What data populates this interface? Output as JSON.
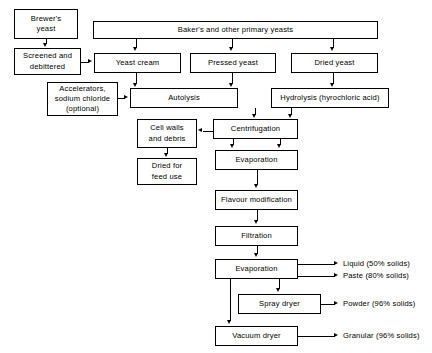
{
  "diagram": {
    "type": "process-flowchart",
    "background_color": "#ffffff",
    "line_color": "#000000",
    "text_color": "#000000",
    "nodes": [
      {
        "id": "brewers_yeast",
        "label": "Brewer's\nyeast",
        "x": 14,
        "y": 9,
        "w": 64,
        "h": 30
      },
      {
        "id": "bakers_yeast",
        "label": "Baker's and other primary yeasts",
        "x": 93,
        "y": 21,
        "w": 285,
        "h": 18
      },
      {
        "id": "screened_debittered",
        "label": "Screened and\ndebittered",
        "x": 14,
        "y": 48,
        "w": 67,
        "h": 27
      },
      {
        "id": "yeast_cream",
        "label": "Yeast cream",
        "x": 94,
        "y": 53,
        "w": 87,
        "h": 20
      },
      {
        "id": "pressed_yeast",
        "label": "Pressed yeast",
        "x": 190,
        "y": 53,
        "w": 86,
        "h": 20
      },
      {
        "id": "dried_yeast",
        "label": "Dried yeast",
        "x": 291,
        "y": 53,
        "w": 87,
        "h": 20
      },
      {
        "id": "accelerators",
        "label": "Accelerators,\nsodium chloride\n(optional)",
        "x": 47,
        "y": 82,
        "w": 71,
        "h": 34
      },
      {
        "id": "autolysis",
        "label": "Autolysis",
        "x": 130,
        "y": 88,
        "w": 108,
        "h": 20
      },
      {
        "id": "hydrolysis",
        "label": "Hydrolysis (hyrochloric acid)",
        "x": 271,
        "y": 88,
        "w": 118,
        "h": 20
      },
      {
        "id": "cell_walls",
        "label": "Cell walls\nand debris",
        "x": 137,
        "y": 119,
        "w": 60,
        "h": 29
      },
      {
        "id": "centrifugation",
        "label": "Centrifugation",
        "x": 213,
        "y": 119,
        "w": 85,
        "h": 20
      },
      {
        "id": "dried_feed_use",
        "label": "Dried for\nfeed use",
        "x": 137,
        "y": 158,
        "w": 60,
        "h": 27
      },
      {
        "id": "evaporation_1",
        "label": "Evaporation",
        "x": 215,
        "y": 150,
        "w": 83,
        "h": 20
      },
      {
        "id": "flavour_modification",
        "label": "Flavour modification",
        "x": 215,
        "y": 190,
        "w": 83,
        "h": 20
      },
      {
        "id": "filtration",
        "label": "Filtration",
        "x": 215,
        "y": 226,
        "w": 83,
        "h": 20
      },
      {
        "id": "evaporation_2",
        "label": "Evaporation",
        "x": 215,
        "y": 259,
        "w": 83,
        "h": 20
      },
      {
        "id": "spray_dryer",
        "label": "Spray dryer",
        "x": 238,
        "y": 294,
        "w": 83,
        "h": 20
      },
      {
        "id": "vacuum_dryer",
        "label": "Vacuum dryer",
        "x": 215,
        "y": 326,
        "w": 83,
        "h": 20
      }
    ],
    "output_labels": [
      {
        "id": "liquid_output",
        "label": "Liquid (50% solids)",
        "x": 343,
        "y": 259
      },
      {
        "id": "paste_output",
        "label": "Paste (80% solids)",
        "x": 343,
        "y": 271
      },
      {
        "id": "powder_output",
        "label": "Powder (96% solids)",
        "x": 343,
        "y": 299
      },
      {
        "id": "granular_output",
        "label": "Granular (96% solids)",
        "x": 343,
        "y": 331
      }
    ],
    "flows": [
      {
        "from": "brewers_yeast",
        "to": "screened_debittered"
      },
      {
        "from": "screened_debittered",
        "to": "yeast_cream"
      },
      {
        "from": "bakers_yeast",
        "to": "yeast_cream"
      },
      {
        "from": "bakers_yeast",
        "to": "pressed_yeast"
      },
      {
        "from": "bakers_yeast",
        "to": "dried_yeast"
      },
      {
        "from": "yeast_cream",
        "to": "autolysis"
      },
      {
        "from": "pressed_yeast",
        "to": "autolysis"
      },
      {
        "from": "accelerators",
        "to": "autolysis"
      },
      {
        "from": "dried_yeast",
        "to": "hydrolysis"
      },
      {
        "from": "autolysis",
        "to": "centrifugation"
      },
      {
        "from": "hydrolysis",
        "to": "centrifugation"
      },
      {
        "from": "centrifugation",
        "to": "cell_walls"
      },
      {
        "from": "cell_walls",
        "to": "dried_feed_use"
      },
      {
        "from": "centrifugation",
        "to": "evaporation_1"
      },
      {
        "from": "evaporation_1",
        "to": "flavour_modification"
      },
      {
        "from": "flavour_modification",
        "to": "filtration"
      },
      {
        "from": "filtration",
        "to": "evaporation_2"
      },
      {
        "from": "evaporation_2",
        "to": "liquid_output"
      },
      {
        "from": "evaporation_2",
        "to": "paste_output"
      },
      {
        "from": "evaporation_2",
        "to": "spray_dryer"
      },
      {
        "from": "evaporation_2",
        "to": "vacuum_dryer"
      },
      {
        "from": "spray_dryer",
        "to": "powder_output"
      },
      {
        "from": "vacuum_dryer",
        "to": "granular_output"
      }
    ]
  }
}
